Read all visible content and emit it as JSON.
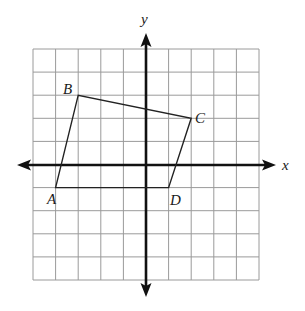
{
  "diagram": {
    "type": "coordinate-plane",
    "x_range": [
      -5,
      5
    ],
    "y_range": [
      -5,
      5
    ],
    "grid_step": 1,
    "axis_labels": {
      "x": "x",
      "y": "y"
    },
    "polygon": {
      "name": "ABCD",
      "vertices": [
        {
          "label": "A",
          "x": -4,
          "y": -1
        },
        {
          "label": "B",
          "x": -3,
          "y": 3
        },
        {
          "label": "C",
          "x": 2,
          "y": 2
        },
        {
          "label": "D",
          "x": 1,
          "y": -1
        }
      ],
      "edges": [
        [
          "A",
          "B"
        ],
        [
          "B",
          "C"
        ],
        [
          "C",
          "D"
        ],
        [
          "D",
          "A"
        ]
      ]
    },
    "colors": {
      "grid": "#9a9a9a",
      "axes": "#111111",
      "polygon": "#222222",
      "background": "#ffffff"
    }
  }
}
